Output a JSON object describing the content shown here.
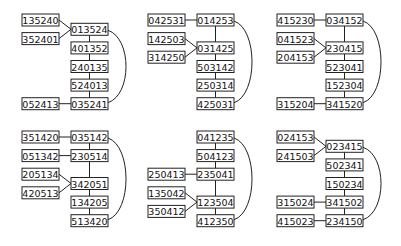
{
  "panels": [
    {
      "id": "p1",
      "nodes": [
        {
          "id": "135240",
          "col": 0,
          "row": 0
        },
        {
          "id": "352401",
          "col": 0,
          "row": 1
        },
        {
          "id": "013524",
          "col": 1,
          "row": 0.5
        },
        {
          "id": "401352",
          "col": 1,
          "row": 1.5
        },
        {
          "id": "240135",
          "col": 1,
          "row": 2.5
        },
        {
          "id": "524013",
          "col": 1,
          "row": 3.5
        },
        {
          "id": "035241",
          "col": 1,
          "row": 4.5
        },
        {
          "id": "052413",
          "col": 0,
          "row": 4.5
        }
      ],
      "edges": [
        [
          "135240",
          "013524"
        ],
        [
          "352401",
          "013524"
        ],
        [
          "013524",
          "401352"
        ],
        [
          "401352",
          "240135"
        ],
        [
          "240135",
          "524013"
        ],
        [
          "524013",
          "035241"
        ],
        [
          "052413",
          "035241"
        ]
      ],
      "arc": [
        "013524",
        "035241"
      ]
    },
    {
      "id": "p2",
      "nodes": [
        {
          "id": "042531",
          "col": 0,
          "row": 0
        },
        {
          "id": "014253",
          "col": 1,
          "row": 0
        },
        {
          "id": "142503",
          "col": 0,
          "row": 1
        },
        {
          "id": "314250",
          "col": 0,
          "row": 2
        },
        {
          "id": "031425",
          "col": 1,
          "row": 1.5
        },
        {
          "id": "503142",
          "col": 1,
          "row": 2.5
        },
        {
          "id": "250314",
          "col": 1,
          "row": 3.5
        },
        {
          "id": "425031",
          "col": 1,
          "row": 4.5
        }
      ],
      "edges": [
        [
          "042531",
          "014253"
        ],
        [
          "014253",
          "031425"
        ],
        [
          "142503",
          "031425"
        ],
        [
          "314250",
          "031425"
        ],
        [
          "031425",
          "503142"
        ],
        [
          "503142",
          "250314"
        ],
        [
          "250314",
          "425031"
        ]
      ],
      "arc": [
        "014253",
        "425031"
      ]
    },
    {
      "id": "p3",
      "nodes": [
        {
          "id": "415230",
          "col": 0,
          "row": 0
        },
        {
          "id": "034152",
          "col": 1,
          "row": 0
        },
        {
          "id": "041523",
          "col": 0,
          "row": 1
        },
        {
          "id": "204153",
          "col": 0,
          "row": 2
        },
        {
          "id": "230415",
          "col": 1,
          "row": 1.5
        },
        {
          "id": "523041",
          "col": 1,
          "row": 2.5
        },
        {
          "id": "152304",
          "col": 1,
          "row": 3.5
        },
        {
          "id": "341520",
          "col": 1,
          "row": 4.5
        },
        {
          "id": "315204",
          "col": 0,
          "row": 4.5
        }
      ],
      "edges": [
        [
          "415230",
          "034152"
        ],
        [
          "034152",
          "230415"
        ],
        [
          "041523",
          "230415"
        ],
        [
          "204153",
          "230415"
        ],
        [
          "230415",
          "523041"
        ],
        [
          "523041",
          "152304"
        ],
        [
          "152304",
          "341520"
        ],
        [
          "315204",
          "341520"
        ]
      ],
      "arc": [
        "034152",
        "341520"
      ]
    },
    {
      "id": "p4",
      "nodes": [
        {
          "id": "351420",
          "col": 0,
          "row": 0
        },
        {
          "id": "035142",
          "col": 1,
          "row": 0
        },
        {
          "id": "051342",
          "col": 0,
          "row": 1
        },
        {
          "id": "230514",
          "col": 1,
          "row": 1
        },
        {
          "id": "205134",
          "col": 0,
          "row": 2
        },
        {
          "id": "420513",
          "col": 0,
          "row": 3
        },
        {
          "id": "342051",
          "col": 1,
          "row": 2.5
        },
        {
          "id": "134205",
          "col": 1,
          "row": 3.5
        },
        {
          "id": "513420",
          "col": 1,
          "row": 4.5
        }
      ],
      "edges": [
        [
          "351420",
          "035142"
        ],
        [
          "035142",
          "230514"
        ],
        [
          "051342",
          "230514"
        ],
        [
          "230514",
          "342051"
        ],
        [
          "205134",
          "342051"
        ],
        [
          "420513",
          "342051"
        ],
        [
          "342051",
          "134205"
        ],
        [
          "134205",
          "513420"
        ]
      ],
      "arc": [
        "035142",
        "513420"
      ]
    },
    {
      "id": "p5",
      "nodes": [
        {
          "id": "041235",
          "col": 1,
          "row": 0
        },
        {
          "id": "504123",
          "col": 1,
          "row": 1
        },
        {
          "id": "250413",
          "col": 0,
          "row": 2
        },
        {
          "id": "235041",
          "col": 1,
          "row": 2
        },
        {
          "id": "135042",
          "col": 0,
          "row": 3
        },
        {
          "id": "350412",
          "col": 0,
          "row": 4
        },
        {
          "id": "123504",
          "col": 1,
          "row": 3.5
        },
        {
          "id": "412350",
          "col": 1,
          "row": 4.5
        }
      ],
      "edges": [
        [
          "041235",
          "504123"
        ],
        [
          "504123",
          "235041"
        ],
        [
          "250413",
          "235041"
        ],
        [
          "235041",
          "123504"
        ],
        [
          "135042",
          "123504"
        ],
        [
          "350412",
          "123504"
        ],
        [
          "123504",
          "412350"
        ]
      ],
      "arc": [
        "041235",
        "412350"
      ]
    },
    {
      "id": "p6",
      "nodes": [
        {
          "id": "024153",
          "col": 0,
          "row": 0
        },
        {
          "id": "241503",
          "col": 0,
          "row": 1
        },
        {
          "id": "023415",
          "col": 1,
          "row": 0.5
        },
        {
          "id": "502341",
          "col": 1,
          "row": 1.5
        },
        {
          "id": "150234",
          "col": 1,
          "row": 2.5
        },
        {
          "id": "315024",
          "col": 0,
          "row": 3.5
        },
        {
          "id": "341502",
          "col": 1,
          "row": 3.5
        },
        {
          "id": "415023",
          "col": 0,
          "row": 4.5
        },
        {
          "id": "234150",
          "col": 1,
          "row": 4.5
        }
      ],
      "edges": [
        [
          "024153",
          "023415"
        ],
        [
          "241503",
          "023415"
        ],
        [
          "023415",
          "502341"
        ],
        [
          "502341",
          "150234"
        ],
        [
          "150234",
          "341502"
        ],
        [
          "315024",
          "341502"
        ],
        [
          "341502",
          "234150"
        ],
        [
          "415023",
          "234150"
        ]
      ],
      "arc": [
        "023415",
        "234150"
      ]
    }
  ]
}
